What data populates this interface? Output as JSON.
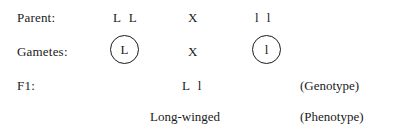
{
  "diagram": {
    "rows": {
      "parent": {
        "label": "Parent:",
        "left_genotype": "L L",
        "cross_symbol": "X",
        "right_genotype": "l l"
      },
      "gametes": {
        "label": "Gametes:",
        "left_gamete": "L",
        "cross_symbol": "X",
        "right_gamete": "l"
      },
      "f1": {
        "label": "F1:",
        "genotype": "L l",
        "genotype_note": "(Genotype)"
      },
      "phenotype": {
        "value": "Long-winged",
        "phenotype_note": "(Phenotype)"
      }
    }
  },
  "colors": {
    "background": "#ffffff",
    "text": "#1a1a1a",
    "circle_stroke": "#1a1a1a"
  }
}
